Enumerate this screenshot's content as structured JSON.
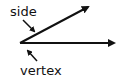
{
  "diagram": {
    "labels": {
      "side": "side",
      "vertex": "vertex"
    },
    "color": "#111111"
  }
}
